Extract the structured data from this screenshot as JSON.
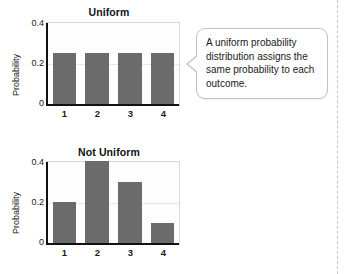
{
  "callout": {
    "text": "A uniform probability distribution assigns the same probability to each outcome."
  },
  "colors": {
    "bar": "#6b6b6b",
    "axis": "#111111",
    "plot_border": "#d7d7d7",
    "gridline": "#e6e6e6",
    "callout_border": "#c2c2c2"
  },
  "chart_data": [
    {
      "type": "bar",
      "title": "Uniform",
      "xlabel": "",
      "ylabel": "Probability",
      "categories": [
        "1",
        "2",
        "3",
        "4"
      ],
      "values": [
        0.25,
        0.25,
        0.25,
        0.25
      ],
      "ylim": [
        0,
        0.4
      ],
      "yticks": [
        "0.4",
        "0.2",
        "0"
      ],
      "ytick_values": [
        0.4,
        0.2,
        0
      ],
      "grid": true,
      "legend": "none"
    },
    {
      "type": "bar",
      "title": "Not Uniform",
      "xlabel": "",
      "ylabel": "Probability",
      "categories": [
        "1",
        "2",
        "3",
        "4"
      ],
      "values": [
        0.2,
        0.4,
        0.3,
        0.1
      ],
      "ylim": [
        0,
        0.4
      ],
      "yticks": [
        "0.4",
        "0.2",
        "0"
      ],
      "ytick_values": [
        0.4,
        0.2,
        0
      ],
      "grid": true,
      "legend": "none"
    }
  ]
}
